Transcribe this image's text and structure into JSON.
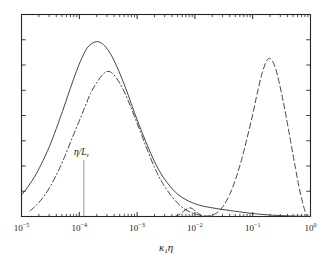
{
  "figure": {
    "background_color": "#ffffff",
    "frame_color": "#262626",
    "curve_color": "#3a3a3a"
  },
  "axes": {
    "x": {
      "label_base": "κ",
      "label_sub": "1",
      "label_tail": "η",
      "scale": "log",
      "min": 1e-05,
      "max": 1.0,
      "tick_mantissa": "10",
      "ticks": [
        {
          "value": 1e-05,
          "exponent": "−5"
        },
        {
          "value": 0.0001,
          "exponent": "−4"
        },
        {
          "value": 0.001,
          "exponent": "−3"
        },
        {
          "value": 0.01,
          "exponent": "−2"
        },
        {
          "value": 0.1,
          "exponent": "−1"
        },
        {
          "value": 1.0,
          "exponent": "0"
        }
      ]
    },
    "y": {
      "label": "",
      "scale": "linear",
      "min": 0,
      "max": 1.08,
      "tick_count": 8,
      "tick_labels": []
    }
  },
  "annotations": [
    {
      "name": "eta-over-L-epsilon",
      "text_numerator": "η",
      "text_slash": "/",
      "text_denominator": "L",
      "text_subscript": "ε",
      "x_value": 0.00012,
      "pointer": true
    }
  ],
  "chart_data": {
    "type": "line",
    "title": "",
    "xlabel": "κ₁η",
    "ylabel": "",
    "xscale": "log",
    "xlim": [
      1e-05,
      1.0
    ],
    "ylim": [
      0,
      1.08
    ],
    "grid": false,
    "legend": "none",
    "series": [
      {
        "name": "solid-curve",
        "style": "solid",
        "peak_x": 0.0002,
        "peak_y": 0.935,
        "points": [
          [
            1e-05,
            0.115
          ],
          [
            1.3e-05,
            0.16
          ],
          [
            1.7e-05,
            0.215
          ],
          [
            2.2e-05,
            0.28
          ],
          [
            3e-05,
            0.37
          ],
          [
            4e-05,
            0.47
          ],
          [
            5.5e-05,
            0.59
          ],
          [
            7e-05,
            0.685
          ],
          [
            9e-05,
            0.78
          ],
          [
            0.00012,
            0.87
          ],
          [
            0.00015,
            0.915
          ],
          [
            0.0002,
            0.935
          ],
          [
            0.00026,
            0.92
          ],
          [
            0.00033,
            0.88
          ],
          [
            0.00042,
            0.82
          ],
          [
            0.00055,
            0.735
          ],
          [
            0.0007,
            0.65
          ],
          [
            0.0009,
            0.555
          ],
          [
            0.0012,
            0.455
          ],
          [
            0.0016,
            0.36
          ],
          [
            0.0021,
            0.28
          ],
          [
            0.0028,
            0.212
          ],
          [
            0.0038,
            0.158
          ],
          [
            0.005,
            0.12
          ],
          [
            0.0068,
            0.092
          ],
          [
            0.009,
            0.074
          ],
          [
            0.012,
            0.06
          ],
          [
            0.017,
            0.05
          ],
          [
            0.024,
            0.042
          ],
          [
            0.034,
            0.035
          ],
          [
            0.05,
            0.028
          ],
          [
            0.07,
            0.022
          ],
          [
            0.1,
            0.016
          ],
          [
            0.15,
            0.011
          ],
          [
            0.22,
            0.007
          ],
          [
            0.35,
            0.004
          ],
          [
            0.6,
            0.002
          ],
          [
            1.0,
            0.0
          ]
        ]
      },
      {
        "name": "dash-dot-curve",
        "style": "dashdot",
        "peak_x": 0.0003,
        "peak_y": 0.775,
        "points": [
          [
            1.4e-05,
            0.03
          ],
          [
            1.8e-05,
            0.06
          ],
          [
            2.4e-05,
            0.105
          ],
          [
            3.2e-05,
            0.165
          ],
          [
            4.2e-05,
            0.235
          ],
          [
            5.5e-05,
            0.315
          ],
          [
            7.2e-05,
            0.405
          ],
          [
            9.5e-05,
            0.495
          ],
          [
            0.000125,
            0.585
          ],
          [
            0.00016,
            0.665
          ],
          [
            0.00021,
            0.725
          ],
          [
            0.00026,
            0.762
          ],
          [
            0.0003,
            0.775
          ],
          [
            0.00036,
            0.77
          ],
          [
            0.00044,
            0.74
          ],
          [
            0.00055,
            0.69
          ],
          [
            0.0007,
            0.62
          ],
          [
            0.0009,
            0.535
          ],
          [
            0.0012,
            0.435
          ],
          [
            0.0016,
            0.335
          ],
          [
            0.0021,
            0.248
          ],
          [
            0.0028,
            0.175
          ],
          [
            0.0038,
            0.115
          ],
          [
            0.005,
            0.072
          ],
          [
            0.0065,
            0.042
          ],
          [
            0.0085,
            0.022
          ],
          [
            0.011,
            0.01
          ],
          [
            0.014,
            0.004
          ],
          [
            0.018,
            0.001
          ],
          [
            0.024,
            0.0
          ]
        ]
      },
      {
        "name": "dashed-curve",
        "style": "dashed",
        "peak_x": 0.19,
        "peak_y": 0.845,
        "secondary_bump_x": 0.008,
        "secondary_bump_y": 0.045,
        "points": [
          [
            0.0045,
            0.0
          ],
          [
            0.0055,
            0.012
          ],
          [
            0.0065,
            0.03
          ],
          [
            0.0075,
            0.042
          ],
          [
            0.0082,
            0.046
          ],
          [
            0.009,
            0.042
          ],
          [
            0.01,
            0.03
          ],
          [
            0.0115,
            0.016
          ],
          [
            0.013,
            0.006
          ],
          [
            0.015,
            0.002
          ],
          [
            0.018,
            0.004
          ],
          [
            0.023,
            0.016
          ],
          [
            0.03,
            0.05
          ],
          [
            0.04,
            0.118
          ],
          [
            0.052,
            0.21
          ],
          [
            0.065,
            0.31
          ],
          [
            0.08,
            0.42
          ],
          [
            0.1,
            0.545
          ],
          [
            0.12,
            0.66
          ],
          [
            0.145,
            0.765
          ],
          [
            0.17,
            0.825
          ],
          [
            0.19,
            0.845
          ],
          [
            0.215,
            0.835
          ],
          [
            0.25,
            0.79
          ],
          [
            0.29,
            0.71
          ],
          [
            0.34,
            0.61
          ],
          [
            0.4,
            0.495
          ],
          [
            0.47,
            0.375
          ],
          [
            0.55,
            0.258
          ],
          [
            0.63,
            0.16
          ],
          [
            0.72,
            0.082
          ],
          [
            0.8,
            0.03
          ],
          [
            0.86,
            0.004
          ]
        ]
      }
    ]
  }
}
